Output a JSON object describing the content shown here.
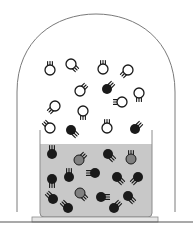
{
  "diagram": {
    "title": "",
    "colors": {
      "background": "#ffffff",
      "jar_outline": "#7a7a7a",
      "liquid": "#c8c8c8",
      "beaker_outline": "#8c8c8c",
      "base": "#e6e6e6",
      "base_outline": "#8c8c8c",
      "floor_line": "#555555",
      "solvent_particle": "#1a1a1a",
      "solute_particle": "#808080",
      "vapor_particle_stroke": "#1a1a1a"
    },
    "legend": {
      "open_circle": "solvent molecule (vapor)",
      "black_circle": "solvent molecule (liquid or vapor)",
      "gray_circle": "solute particle"
    },
    "particles": [
      {
        "x": 50,
        "y": 70,
        "type": "vapor-open",
        "dir": "up"
      },
      {
        "x": 71,
        "y": 64,
        "type": "vapor-open",
        "dir": "down-right"
      },
      {
        "x": 103,
        "y": 69,
        "type": "vapor-open",
        "dir": "up"
      },
      {
        "x": 128,
        "y": 70,
        "type": "vapor-open",
        "dir": "down-left"
      },
      {
        "x": 80,
        "y": 91,
        "type": "vapor-open",
        "dir": "up-right"
      },
      {
        "x": 107,
        "y": 89,
        "type": "vapor-solid",
        "dir": "up-right"
      },
      {
        "x": 139,
        "y": 93,
        "type": "vapor-open",
        "dir": "down"
      },
      {
        "x": 122,
        "y": 102,
        "type": "vapor-open",
        "dir": "left"
      },
      {
        "x": 55,
        "y": 106,
        "type": "vapor-open",
        "dir": "down-left"
      },
      {
        "x": 83,
        "y": 111,
        "type": "vapor-open",
        "dir": "down"
      },
      {
        "x": 50,
        "y": 128,
        "type": "vapor-open",
        "dir": "up-left"
      },
      {
        "x": 71,
        "y": 130,
        "type": "vapor-solid",
        "dir": "down-right"
      },
      {
        "x": 107,
        "y": 128,
        "type": "vapor-open",
        "dir": "up"
      },
      {
        "x": 135,
        "y": 129,
        "type": "vapor-solid",
        "dir": "up-right"
      },
      {
        "x": 52,
        "y": 154,
        "type": "liquid-solid",
        "dir": "up"
      },
      {
        "x": 79,
        "y": 160,
        "type": "liquid-gray",
        "dir": "up-right"
      },
      {
        "x": 108,
        "y": 154,
        "type": "liquid-solid",
        "dir": "down-right"
      },
      {
        "x": 131,
        "y": 159,
        "type": "liquid-gray",
        "dir": "up"
      },
      {
        "x": 95,
        "y": 173,
        "type": "liquid-solid",
        "dir": "left"
      },
      {
        "x": 52,
        "y": 179,
        "type": "liquid-solid",
        "dir": "down"
      },
      {
        "x": 69,
        "y": 177,
        "type": "liquid-solid",
        "dir": "up"
      },
      {
        "x": 117,
        "y": 177,
        "type": "liquid-solid",
        "dir": "down-right"
      },
      {
        "x": 138,
        "y": 177,
        "type": "liquid-solid",
        "dir": "down-left"
      },
      {
        "x": 80,
        "y": 193,
        "type": "liquid-gray",
        "dir": "down-right"
      },
      {
        "x": 53,
        "y": 199,
        "type": "liquid-solid",
        "dir": "up-left"
      },
      {
        "x": 101,
        "y": 197,
        "type": "liquid-solid",
        "dir": "right"
      },
      {
        "x": 128,
        "y": 196,
        "type": "liquid-solid",
        "dir": "down-right"
      },
      {
        "x": 68,
        "y": 208,
        "type": "liquid-solid",
        "dir": "up-left"
      },
      {
        "x": 114,
        "y": 208,
        "type": "liquid-solid",
        "dir": "up-right"
      }
    ]
  }
}
